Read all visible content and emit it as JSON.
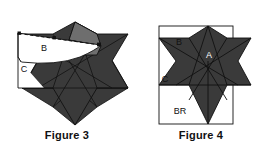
{
  "figures": [
    {
      "id": "figure-3",
      "caption": "Figure 3",
      "labels": {
        "b": "B",
        "c": "C"
      },
      "colors": {
        "star_fill": "#3a3a3a",
        "flap_fill": "#6e6e6e",
        "white_fill": "#ffffff",
        "outline": "#111111",
        "label_text": "#111111"
      }
    },
    {
      "id": "figure-4",
      "caption": "Figure 4",
      "labels": {
        "a": "A",
        "b": "B",
        "c": "C",
        "br": "BR"
      },
      "colors": {
        "star_fill": "#3a3a3a",
        "white_fill": "#ffffff",
        "outline": "#111111",
        "label_text": "#111111",
        "label_text_on_dark": "#ffffff"
      }
    }
  ],
  "page": {
    "background": "#ffffff",
    "width": 268,
    "height": 155
  }
}
